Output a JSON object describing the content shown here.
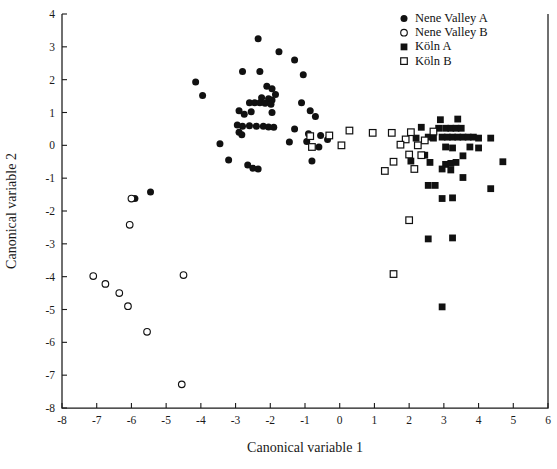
{
  "chart_data": {
    "type": "scatter",
    "title": "",
    "xlabel": "Canonical variable 1",
    "ylabel": "Canonical variable 2",
    "xlim": [
      -8,
      6
    ],
    "ylim": [
      -8,
      4
    ],
    "xticks": [
      -8,
      -7,
      -6,
      -5,
      -4,
      -3,
      -2,
      -1,
      0,
      1,
      2,
      3,
      4,
      5,
      6
    ],
    "yticks": [
      -8,
      -7,
      -6,
      -5,
      -4,
      -3,
      -2,
      -1,
      0,
      1,
      2,
      3,
      4
    ],
    "xtick_labels": [
      "-8",
      "-7",
      "-6",
      "-5",
      "-4",
      "-3",
      "-2",
      "-1",
      "0",
      "1",
      "2",
      "3",
      "4",
      "5",
      "6"
    ],
    "ytick_labels": [
      "-8",
      "-7",
      "-6",
      "-5",
      "-4",
      "-3",
      "-2",
      "-1",
      "0",
      "1",
      "2",
      "3",
      "4"
    ],
    "grid": false,
    "legend_position": "top-right",
    "series": [
      {
        "name": "Nene Valley A",
        "marker": "filled-circle",
        "color": "#111111",
        "points": [
          [
            -2.35,
            3.25
          ],
          [
            -1.75,
            2.85
          ],
          [
            -1.3,
            2.6
          ],
          [
            -2.8,
            2.25
          ],
          [
            -2.3,
            2.25
          ],
          [
            -1.05,
            2.15
          ],
          [
            -4.15,
            1.93
          ],
          [
            -3.95,
            1.52
          ],
          [
            -2.1,
            1.8
          ],
          [
            -1.95,
            1.72
          ],
          [
            -1.85,
            1.55
          ],
          [
            -2.25,
            1.45
          ],
          [
            -2.05,
            1.42
          ],
          [
            -1.95,
            1.38
          ],
          [
            -2.6,
            1.3
          ],
          [
            -2.45,
            1.3
          ],
          [
            -2.3,
            1.3
          ],
          [
            -2.15,
            1.28
          ],
          [
            -1.98,
            1.25
          ],
          [
            -1.1,
            1.3
          ],
          [
            -2.9,
            1.05
          ],
          [
            -2.75,
            0.95
          ],
          [
            -2.55,
            1.02
          ],
          [
            -1.95,
            1.0
          ],
          [
            -0.85,
            1.05
          ],
          [
            -0.7,
            0.88
          ],
          [
            -2.95,
            0.62
          ],
          [
            -2.8,
            0.58
          ],
          [
            -2.6,
            0.6
          ],
          [
            -2.4,
            0.58
          ],
          [
            -2.2,
            0.58
          ],
          [
            -2.05,
            0.56
          ],
          [
            -1.9,
            0.55
          ],
          [
            -2.9,
            0.4
          ],
          [
            -2.82,
            0.32
          ],
          [
            -1.3,
            0.5
          ],
          [
            -0.9,
            0.35
          ],
          [
            -0.55,
            0.3
          ],
          [
            -3.45,
            0.05
          ],
          [
            -1.45,
            0.1
          ],
          [
            -0.95,
            0.12
          ],
          [
            -0.35,
            0.18
          ],
          [
            -0.6,
            -0.05
          ],
          [
            -3.2,
            -0.45
          ],
          [
            -2.65,
            -0.6
          ],
          [
            -2.5,
            -0.7
          ],
          [
            -2.35,
            -0.72
          ],
          [
            -0.8,
            -0.48
          ],
          [
            -5.45,
            -1.42
          ],
          [
            -5.9,
            -1.62
          ]
        ]
      },
      {
        "name": "Nene Valley B",
        "marker": "open-circle",
        "color": "#111111",
        "points": [
          [
            -6.0,
            -1.62
          ],
          [
            -6.05,
            -2.42
          ],
          [
            -7.1,
            -3.98
          ],
          [
            -6.75,
            -4.22
          ],
          [
            -4.5,
            -3.95
          ],
          [
            -6.35,
            -4.5
          ],
          [
            -6.1,
            -4.9
          ],
          [
            -5.55,
            -5.68
          ],
          [
            -4.55,
            -7.28
          ]
        ]
      },
      {
        "name": "Köln A",
        "marker": "filled-square",
        "color": "#111111",
        "points": [
          [
            2.9,
            0.78
          ],
          [
            3.4,
            0.8
          ],
          [
            2.35,
            0.55
          ],
          [
            2.85,
            0.52
          ],
          [
            3.05,
            0.52
          ],
          [
            3.2,
            0.52
          ],
          [
            3.35,
            0.52
          ],
          [
            3.5,
            0.52
          ],
          [
            2.55,
            0.25
          ],
          [
            2.7,
            0.22
          ],
          [
            2.95,
            0.25
          ],
          [
            3.1,
            0.25
          ],
          [
            3.25,
            0.25
          ],
          [
            3.4,
            0.25
          ],
          [
            3.55,
            0.25
          ],
          [
            3.7,
            0.25
          ],
          [
            3.85,
            0.25
          ],
          [
            4.0,
            0.22
          ],
          [
            2.2,
            0.22
          ],
          [
            4.35,
            0.22
          ],
          [
            3.05,
            -0.05
          ],
          [
            3.25,
            -0.08
          ],
          [
            3.75,
            -0.05
          ],
          [
            4.0,
            -0.08
          ],
          [
            2.45,
            -0.3
          ],
          [
            3.55,
            -0.32
          ],
          [
            2.05,
            -0.48
          ],
          [
            2.6,
            -0.52
          ],
          [
            3.05,
            -0.58
          ],
          [
            3.2,
            -0.55
          ],
          [
            3.35,
            -0.52
          ],
          [
            4.7,
            -0.5
          ],
          [
            2.95,
            -0.72
          ],
          [
            3.2,
            -0.75
          ],
          [
            3.55,
            -0.98
          ],
          [
            2.55,
            -1.22
          ],
          [
            2.75,
            -1.22
          ],
          [
            4.35,
            -1.32
          ],
          [
            2.95,
            -1.62
          ],
          [
            3.25,
            -1.6
          ],
          [
            2.55,
            -2.85
          ],
          [
            3.25,
            -2.82
          ],
          [
            2.95,
            -4.92
          ]
        ]
      },
      {
        "name": "Köln B",
        "marker": "open-square",
        "color": "#111111",
        "points": [
          [
            -0.85,
            0.28
          ],
          [
            -0.3,
            0.3
          ],
          [
            0.28,
            0.45
          ],
          [
            0.95,
            0.38
          ],
          [
            1.5,
            0.38
          ],
          [
            2.05,
            0.4
          ],
          [
            2.7,
            0.42
          ],
          [
            1.9,
            0.18
          ],
          [
            2.45,
            0.15
          ],
          [
            -0.8,
            -0.05
          ],
          [
            0.05,
            0.0
          ],
          [
            1.75,
            0.02
          ],
          [
            2.25,
            0.0
          ],
          [
            2.0,
            -0.28
          ],
          [
            2.35,
            -0.3
          ],
          [
            1.55,
            -0.5
          ],
          [
            2.15,
            -0.72
          ],
          [
            1.3,
            -0.78
          ],
          [
            2.0,
            -2.28
          ],
          [
            1.55,
            -3.92
          ]
        ]
      }
    ]
  },
  "legend": {
    "items": [
      {
        "label": "Nene Valley A",
        "marker": "filled-circle"
      },
      {
        "label": "Nene Valley B",
        "marker": "open-circle"
      },
      {
        "label": "Köln A",
        "marker": "filled-square"
      },
      {
        "label": "Köln B",
        "marker": "open-square"
      }
    ]
  }
}
